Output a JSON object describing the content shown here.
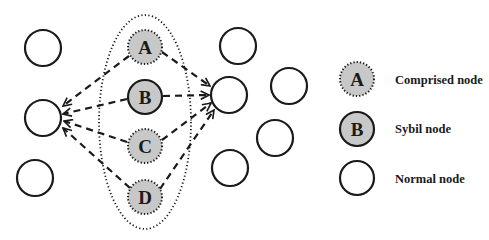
{
  "diagram": {
    "colors": {
      "stroke": "#1a1a1a",
      "node_fill": "#c8c8c8",
      "normal_fill": "#ffffff"
    },
    "sybil_group": {
      "nodes": [
        {
          "id": "A",
          "label": "A",
          "type": "compromised"
        },
        {
          "id": "B",
          "label": "B",
          "type": "sybil"
        },
        {
          "id": "C",
          "label": "C",
          "type": "compromised"
        },
        {
          "id": "D",
          "label": "D",
          "type": "compromised"
        }
      ]
    },
    "normal_nodes_count": 8,
    "edges": [
      {
        "from": "A",
        "to": "left-target",
        "style": "dashed-arrow"
      },
      {
        "from": "B",
        "to": "left-target",
        "style": "dashed-arrow"
      },
      {
        "from": "C",
        "to": "left-target",
        "style": "dashed-arrow"
      },
      {
        "from": "D",
        "to": "left-target",
        "style": "dashed-arrow"
      },
      {
        "from": "A",
        "to": "right-target",
        "style": "dashed-arrow"
      },
      {
        "from": "B",
        "to": "right-target",
        "style": "dashed-arrow"
      },
      {
        "from": "C",
        "to": "right-target",
        "style": "dashed-arrow"
      },
      {
        "from": "D",
        "to": "right-target",
        "style": "dashed-arrow"
      }
    ]
  },
  "legend": {
    "items": [
      {
        "symbol": "A",
        "label": "Comprised node",
        "style": "dotted-gray"
      },
      {
        "symbol": "B",
        "label": "Sybil node",
        "style": "solid-gray"
      },
      {
        "symbol": "",
        "label": "Normal node",
        "style": "solid-white"
      }
    ]
  }
}
